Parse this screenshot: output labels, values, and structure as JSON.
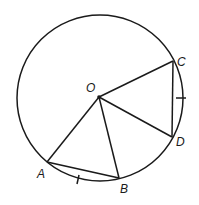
{
  "diagram": {
    "type": "circle-geometry",
    "circle": {
      "cx": 100,
      "cy": 98,
      "r": 83,
      "center_label": "O"
    },
    "points": {
      "O": {
        "label": "O",
        "x": 99,
        "y": 97
      },
      "A": {
        "label": "A",
        "x": 47,
        "y": 162
      },
      "B": {
        "label": "B",
        "x": 119,
        "y": 178
      },
      "C": {
        "label": "C",
        "x": 173,
        "y": 61
      },
      "D": {
        "label": "D",
        "x": 172,
        "y": 137
      }
    },
    "segments": [
      {
        "from": "O",
        "to": "A"
      },
      {
        "from": "O",
        "to": "B"
      },
      {
        "from": "O",
        "to": "C"
      },
      {
        "from": "O",
        "to": "D"
      },
      {
        "from": "A",
        "to": "B"
      },
      {
        "from": "C",
        "to": "D"
      }
    ],
    "equal_arc_marks": [
      "arc AB",
      "arc CD"
    ],
    "stroke_color": "#1a1a1a"
  }
}
